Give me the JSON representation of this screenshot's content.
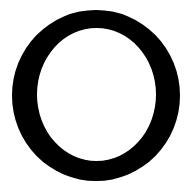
{
  "image": {
    "kind": "scanned-glyph",
    "description": "Large bold serif capital letter O on a plain white background",
    "character": "O",
    "script": "Latin",
    "case": "uppercase",
    "width_px": 191,
    "height_px": 188
  },
  "colors": {
    "ink": "#000000",
    "background": "#ffffff"
  },
  "glyph": {
    "label": "O",
    "style": "serif",
    "weight": "bold",
    "stroke_contrast": "modulated",
    "outer_ellipse": {
      "left_px": 12,
      "right_px": 180,
      "top_px": 10,
      "bottom_px": 181,
      "center_x_px": 96,
      "center_y_px": 95.5,
      "radius_x_px": 84,
      "radius_y_px": 85.5
    },
    "inner_counter": {
      "left_px": 37,
      "right_px": 156,
      "top_px": 28,
      "bottom_px": 161,
      "center_x_px": 96.5,
      "center_y_px": 94.5,
      "radius_x_px": 59.5,
      "radius_y_px": 66.5
    },
    "stroke_px": {
      "left": 25,
      "right": 24,
      "top": 18,
      "bottom": 20
    }
  }
}
